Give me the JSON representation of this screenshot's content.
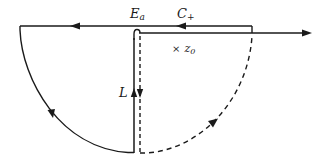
{
  "diagram": {
    "type": "contour-integration-diagram",
    "colors": {
      "stroke": "#1a1a1a",
      "background": "#ffffff"
    },
    "labels": {
      "branch_point": {
        "main": "E",
        "sub": "a"
      },
      "contour": {
        "main": "C",
        "sub": "+"
      },
      "pole": {
        "marker": "×",
        "main": "z",
        "sub": "0"
      },
      "vertical_path": {
        "main": "L"
      }
    },
    "elements": [
      {
        "name": "upper-horizontal-contour",
        "style": "solid",
        "direction": "left"
      },
      {
        "name": "real-axis",
        "style": "solid",
        "direction": "right"
      },
      {
        "name": "left-semicircle-arc",
        "style": "solid",
        "direction": "down"
      },
      {
        "name": "vertical-line-L-solid",
        "style": "solid",
        "direction": "up"
      },
      {
        "name": "vertical-line-dashed",
        "style": "dashed",
        "direction": "down"
      },
      {
        "name": "right-arc-dashed",
        "style": "dashed",
        "direction": "up"
      }
    ]
  }
}
